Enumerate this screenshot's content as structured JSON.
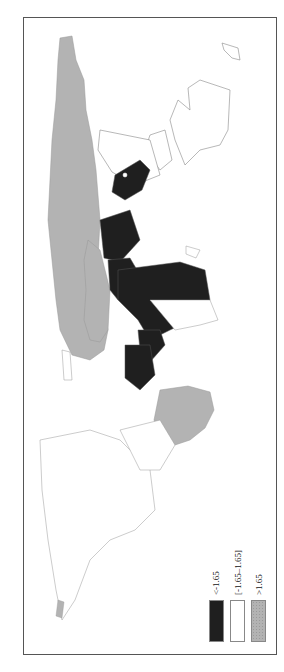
{
  "figure": {
    "type": "choropleth-map",
    "orientation": "rotated-90-counterclockwise",
    "frame": {
      "x": 23,
      "y": 17,
      "width": 254,
      "height": 638,
      "border_color": "#555555"
    }
  },
  "legend": {
    "items": [
      {
        "label": "<-1.65",
        "color": "#1f1f1f",
        "pattern": "solid"
      },
      {
        "label": "[-1.65–1.65]",
        "color": "#ffffff",
        "pattern": "solid"
      },
      {
        "label": ">1.65",
        "color": "#b3b3b3",
        "pattern": "dotted"
      }
    ]
  },
  "regions": {
    "grey_high": [
      "Russia / Northern Asia",
      "China region",
      "South America (Brazil)"
    ],
    "dark_low": [
      "Sub-Saharan Africa",
      "Middle East / Central Asia band"
    ],
    "white_mid": [
      "North America",
      "Europe",
      "Greenland",
      "Australia",
      "Southern Africa"
    ]
  },
  "colors": {
    "dark": "#1f1f1f",
    "grey": "#b3b3b3",
    "outline": "#777777",
    "frame": "#555555"
  }
}
